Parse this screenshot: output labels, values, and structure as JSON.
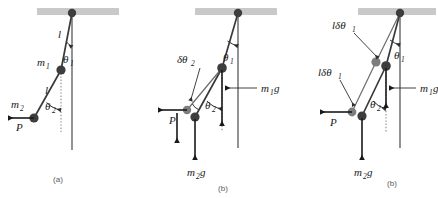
{
  "figure": {
    "type": "physics-diagram",
    "background_color": "#ffffff",
    "ink_color": "#3d3d3d",
    "ceiling_color": "#c9c9c9"
  },
  "panels": [
    {
      "id": "a",
      "label": "(a)",
      "labels": {
        "rod_upper": "l",
        "rod_lower": "l",
        "mass_upper": "m",
        "mass_upper_sub": "1",
        "mass_lower": "m",
        "mass_lower_sub": "2",
        "angle_upper": "θ",
        "angle_upper_sub": "1",
        "angle_lower": "θ",
        "angle_lower_sub": "2",
        "applied_force": "P"
      }
    },
    {
      "id": "b",
      "label": "(b)",
      "labels": {
        "angle_upper": "θ",
        "angle_upper_sub": "1",
        "angle_lower": "θ",
        "angle_lower_sub": "2",
        "virtual_angle": "δθ",
        "virtual_angle_sub": "2",
        "weight_upper": "m",
        "weight_upper_sub": "1",
        "weight_upper_g": "g",
        "weight_lower": "m",
        "weight_lower_sub": "2",
        "weight_lower_g": "g",
        "applied_force": "P"
      }
    },
    {
      "id": "c",
      "label": "(b)",
      "labels": {
        "angle_upper": "θ",
        "angle_upper_sub": "1",
        "angle_lower": "θ",
        "angle_lower_sub": "2",
        "displacement_upper": "lδθ",
        "displacement_upper_sub": "1",
        "displacement_lower": "lδθ",
        "displacement_lower_sub": "1",
        "weight_upper": "m",
        "weight_upper_sub": "1",
        "weight_upper_g": "g",
        "weight_lower": "m",
        "weight_lower_sub": "2",
        "weight_lower_g": "g",
        "applied_force": "P"
      }
    }
  ]
}
